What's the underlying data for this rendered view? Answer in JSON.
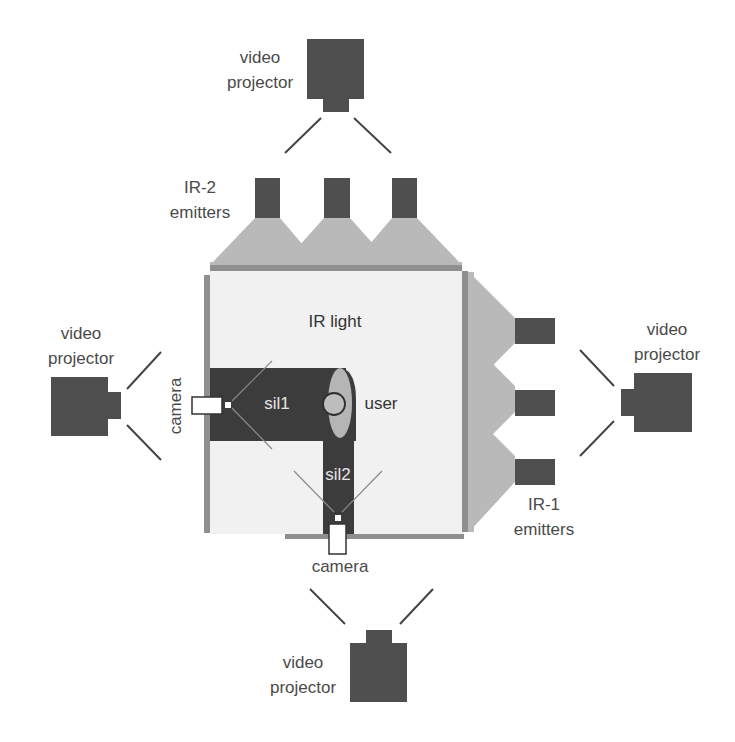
{
  "diagram": {
    "type": "top-down room setup",
    "labels": {
      "projector_top": [
        "video",
        "projector"
      ],
      "projector_left": [
        "video",
        "projector"
      ],
      "projector_right": [
        "video",
        "projector"
      ],
      "projector_bottom": [
        "video",
        "projector"
      ],
      "ir2": [
        "IR-2",
        "emitters"
      ],
      "ir1": [
        "IR-1",
        "emitters"
      ],
      "ir_light": "IR light",
      "user": "user",
      "sil1": "sil1",
      "sil2": "sil2",
      "camera_left": "camera",
      "camera_bottom": "camera"
    },
    "colors": {
      "device": "#4f4f4f",
      "wall": "#8f8f8f",
      "cone": "#b9b9b9",
      "room": "#f2f2f2",
      "silhouette": "#3c3c3c",
      "user_body": "#b5b5b5"
    },
    "components": [
      "4 video projectors (top, left, right, bottom)",
      "3 IR-2 emitters (top)",
      "3 IR-1 emitters (right)",
      "2 cameras (left wall, bottom wall)",
      "user in center casting silhouettes sil1 and sil2"
    ]
  }
}
